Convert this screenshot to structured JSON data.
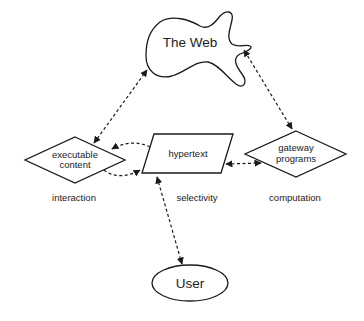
{
  "diagram": {
    "nodes": {
      "web": {
        "label": "The Web",
        "shape": "cloud"
      },
      "executable": {
        "line1": "executable",
        "line2": "content",
        "shape": "diamond"
      },
      "hypertext": {
        "label": "hypertext",
        "shape": "parallelogram"
      },
      "gateway": {
        "line1": "gateway",
        "line2": "programs",
        "shape": "diamond"
      },
      "user": {
        "label": "User",
        "shape": "ellipse"
      }
    },
    "annotations": {
      "interaction": "interaction",
      "selectivity": "selectivity",
      "computation": "computation"
    },
    "edges": [
      {
        "from": "executable",
        "to": "web",
        "style": "dashed",
        "direction": "both"
      },
      {
        "from": "gateway",
        "to": "web",
        "style": "dashed",
        "direction": "both"
      },
      {
        "from": "hypertext",
        "to": "executable",
        "style": "dashed-curved",
        "direction": "forward"
      },
      {
        "from": "executable",
        "to": "hypertext",
        "style": "dashed-curved",
        "direction": "forward"
      },
      {
        "from": "hypertext",
        "to": "gateway",
        "style": "dashed",
        "direction": "both"
      },
      {
        "from": "hypertext",
        "to": "user",
        "style": "dashed",
        "direction": "both"
      }
    ],
    "colors": {
      "stroke": "#1a1a1a",
      "background": "#ffffff",
      "text": "#222222"
    }
  }
}
